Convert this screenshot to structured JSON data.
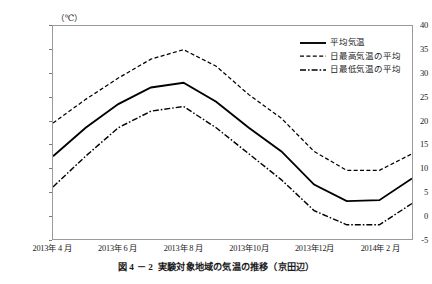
{
  "caption": {
    "number": "図 4 － 2",
    "text": "実験対象地域の気温の推移（京田辺）"
  },
  "axis": {
    "y_unit": "（℃）",
    "y_ticks": [
      "40",
      "35",
      "30",
      "25",
      "20",
      "15",
      "10",
      "5",
      "0",
      "-5"
    ],
    "x_ticks": [
      "2013年 4 月",
      "2013年 6 月",
      "2013年 8 月",
      "2013年10月",
      "2013年12月",
      "2014年 2 月"
    ]
  },
  "legend": {
    "items": [
      {
        "label": "平均気温",
        "style": "solid"
      },
      {
        "label": "日最高気温の平均",
        "style": "dashed"
      },
      {
        "label": "日最低気温の平均",
        "style": "dashdot"
      }
    ]
  },
  "chart_data": {
    "type": "line",
    "title": "実験対象地域の気温の推移（京田辺）",
    "xlabel": "",
    "ylabel": "（℃）",
    "ylim": [
      -5,
      40
    ],
    "ytick_step": 5,
    "grid": false,
    "legend_position": "top-right",
    "categories": [
      "2013年4月",
      "2013年5月",
      "2013年6月",
      "2013年7月",
      "2013年8月",
      "2013年9月",
      "2013年10月",
      "2013年11月",
      "2013年12月",
      "2014年1月",
      "2014年2月",
      "2014年3月"
    ],
    "x_labeled_indices": [
      0,
      2,
      4,
      6,
      8,
      10
    ],
    "series": [
      {
        "name": "平均気温",
        "style": "solid",
        "color": "#000000",
        "values": [
          12.5,
          18.5,
          23.5,
          27.0,
          28.0,
          24.0,
          18.5,
          13.5,
          6.5,
          3.0,
          3.2,
          7.8
        ]
      },
      {
        "name": "日最高気温の平均",
        "style": "dashed",
        "color": "#000000",
        "values": [
          19.5,
          24.5,
          29.0,
          33.0,
          35.0,
          31.5,
          25.5,
          20.5,
          13.5,
          9.5,
          9.5,
          13.0
        ]
      },
      {
        "name": "日最低気温の平均",
        "style": "dashdot",
        "color": "#000000",
        "values": [
          6.0,
          12.5,
          18.5,
          22.0,
          23.0,
          18.5,
          13.0,
          7.5,
          1.0,
          -2.0,
          -2.0,
          2.5
        ]
      }
    ]
  }
}
